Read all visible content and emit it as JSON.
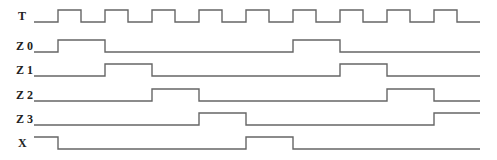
{
  "diagram": {
    "type": "timing-diagram",
    "stroke_color": "#666666",
    "label_color": "#222222",
    "x_end": 480,
    "signals": [
      {
        "name": "T",
        "label_y": 20,
        "high_y": 10,
        "low_y": 22,
        "start_x": 34,
        "initial": 0,
        "edges": [
          58,
          81,
          105,
          128,
          152,
          175,
          199,
          222,
          246,
          269,
          293,
          316,
          340,
          363,
          387,
          410,
          434,
          457
        ]
      },
      {
        "name": "Z 0",
        "label_y": 50,
        "high_y": 40,
        "low_y": 52,
        "start_x": 34,
        "initial": 0,
        "edges": [
          58,
          105,
          293,
          340
        ]
      },
      {
        "name": "Z 1",
        "label_y": 74,
        "high_y": 64,
        "low_y": 76,
        "start_x": 34,
        "initial": 0,
        "edges": [
          105,
          152,
          340,
          387
        ]
      },
      {
        "name": "Z 2",
        "label_y": 99,
        "high_y": 89,
        "low_y": 101,
        "start_x": 34,
        "initial": 0,
        "edges": [
          152,
          199,
          387,
          434
        ]
      },
      {
        "name": "Z 3",
        "label_y": 123,
        "high_y": 113,
        "low_y": 125,
        "start_x": 34,
        "initial": 0,
        "edges": [
          199,
          246,
          434
        ]
      },
      {
        "name": "X",
        "label_y": 147,
        "high_y": 137,
        "low_y": 149,
        "start_x": 34,
        "initial": 1,
        "edges": [
          58,
          246,
          293
        ]
      }
    ]
  }
}
